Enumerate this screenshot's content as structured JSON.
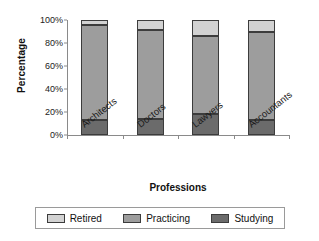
{
  "chart_data": {
    "type": "bar",
    "stacked": true,
    "stack_mode": "percent",
    "title": "",
    "xlabel": "Professions",
    "ylabel": "Percentage",
    "categories": [
      "Architects",
      "Doctors",
      "Lawyers",
      "Accountants"
    ],
    "ylim": [
      0,
      100
    ],
    "yticks": [
      0,
      20,
      40,
      60,
      80,
      100
    ],
    "ytick_labels": [
      "0%",
      "20%",
      "40%",
      "60%",
      "80%",
      "100%"
    ],
    "grid": false,
    "legend_position": "bottom",
    "legend_order": [
      "Retired",
      "Practicing",
      "Studying"
    ],
    "series": [
      {
        "name": "Studying",
        "color": "#6b6b6b",
        "values": [
          13,
          14,
          18,
          13
        ]
      },
      {
        "name": "Practicing",
        "color": "#9d9d9d",
        "values": [
          83,
          77,
          68,
          77
        ]
      },
      {
        "name": "Retired",
        "color": "#d2d2d2",
        "values": [
          4,
          9,
          14,
          10
        ]
      }
    ]
  },
  "axes": {
    "y_title": "Percentage",
    "x_title": "Professions"
  },
  "legend": {
    "items": [
      {
        "label": "Retired",
        "color": "#d2d2d2"
      },
      {
        "label": "Practicing",
        "color": "#9d9d9d"
      },
      {
        "label": "Studying",
        "color": "#6b6b6b"
      }
    ]
  }
}
